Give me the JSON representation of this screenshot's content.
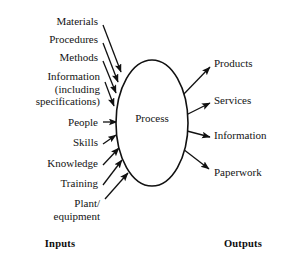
{
  "diagram": {
    "title_center": "Process",
    "ellipse": {
      "cx": 152,
      "cy": 123,
      "rx": 36,
      "ry": 63,
      "stroke": "#111111",
      "fill": "#ffffff",
      "stroke_width": 1.6
    },
    "stroke_color": "#111111",
    "background": "#ffffff",
    "inputs": [
      {
        "label": "Materials",
        "label_x": 98,
        "label_y": 21,
        "tip_x": 121,
        "tip_y": 72,
        "tail_x": 103,
        "tail_y": 25
      },
      {
        "label": "Procedures",
        "label_x": 98,
        "label_y": 39,
        "tip_x": 118,
        "tip_y": 82,
        "tail_x": 103,
        "tail_y": 43
      },
      {
        "label": "Methods",
        "label_x": 98,
        "label_y": 57,
        "tip_x": 116,
        "tip_y": 93,
        "tail_x": 103,
        "tail_y": 61
      },
      {
        "label": "Information\n(including\nspecifications)",
        "label_x": 100,
        "label_y": 76,
        "tip_x": 114,
        "tip_y": 106,
        "tail_x": 105,
        "tail_y": 82
      },
      {
        "label": "People",
        "label_x": 98,
        "label_y": 122,
        "tip_x": 117,
        "tip_y": 122,
        "tail_x": 103,
        "tail_y": 122
      },
      {
        "label": "Skills",
        "label_x": 98,
        "label_y": 142,
        "tip_x": 116,
        "tip_y": 135,
        "tail_x": 103,
        "tail_y": 144
      },
      {
        "label": "Knowledge",
        "label_x": 98,
        "label_y": 163,
        "tip_x": 119,
        "tip_y": 148,
        "tail_x": 103,
        "tail_y": 165
      },
      {
        "label": "Training",
        "label_x": 98,
        "label_y": 183,
        "tip_x": 122,
        "tip_y": 160,
        "tail_x": 103,
        "tail_y": 185
      },
      {
        "label": "Plant/\nequipment",
        "label_x": 100,
        "label_y": 203,
        "tip_x": 128,
        "tip_y": 173,
        "tail_x": 105,
        "tail_y": 199
      }
    ],
    "outputs": [
      {
        "label": "Products",
        "label_x": 214,
        "label_y": 63,
        "tail_x": 181,
        "tail_y": 97,
        "tip_x": 210,
        "tip_y": 67
      },
      {
        "label": "Services",
        "label_x": 214,
        "label_y": 100,
        "tail_x": 186,
        "tail_y": 115,
        "tip_x": 210,
        "tip_y": 103
      },
      {
        "label": "Information",
        "label_x": 214,
        "label_y": 135,
        "tail_x": 187,
        "tail_y": 131,
        "tip_x": 210,
        "tip_y": 137
      },
      {
        "label": "Paperwork",
        "label_x": 214,
        "label_y": 172,
        "tail_x": 183,
        "tail_y": 149,
        "tip_x": 209,
        "tip_y": 169
      }
    ],
    "captions": {
      "inputs": "Inputs",
      "outputs": "Outputs",
      "inputs_x": 60,
      "inputs_y": 243,
      "outputs_x": 243,
      "outputs_y": 243
    }
  }
}
